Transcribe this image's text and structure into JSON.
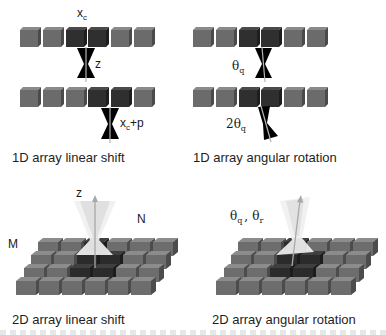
{
  "figure": {
    "panels": [
      {
        "id": "1d-linear-shift",
        "caption": "1D array linear shift",
        "labels": {
          "top": "x",
          "top_sub": "c",
          "beam": "z",
          "shift": "x",
          "shift_sub": "c",
          "shift_suffix": "+p"
        }
      },
      {
        "id": "1d-angular-rotation",
        "caption": "1D array angular rotation",
        "labels": {
          "top": "θ",
          "top_sub": "q",
          "bottom": "2θ",
          "bottom_sub": "q"
        }
      },
      {
        "id": "2d-linear-shift",
        "caption": "2D array linear shift",
        "labels": {
          "axis": "z",
          "rows": "M",
          "cols": "N"
        }
      },
      {
        "id": "2d-angular-rotation",
        "caption": "2D array angular rotation",
        "labels": {
          "a": "θ",
          "a_sub": "q",
          "sep": ",",
          "b": "θ",
          "b_sub": "r"
        }
      }
    ],
    "colors": {
      "cube_light": "#6b6b6b",
      "cube_dark": "#2e2e2e",
      "beam": "#000000",
      "axis_line": "#b0b0b0",
      "cone": "#e8e8e8"
    }
  }
}
